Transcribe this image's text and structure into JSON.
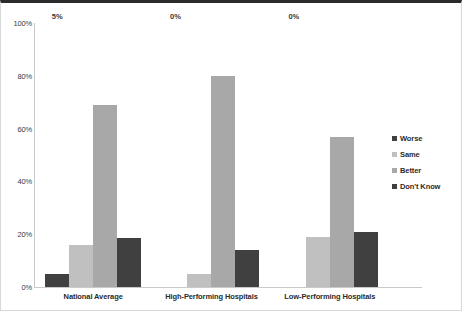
{
  "chart_data": {
    "type": "bar",
    "title": "",
    "xlabel": "",
    "ylabel": "",
    "ylim": [
      0,
      100
    ],
    "ytick_labels": [
      "100%",
      "80%",
      "60%",
      "40%",
      "20%",
      "0%"
    ],
    "ytick_values": [
      100,
      80,
      60,
      40,
      20,
      0
    ],
    "grid": false,
    "legend_position": "right",
    "categories": [
      "National Average",
      "High-Performing Hospitals",
      "Low-Performing Hospitals"
    ],
    "series": [
      {
        "name": "Worse",
        "color": "#404040",
        "values": [
          5,
          0,
          0
        ]
      },
      {
        "name": "Same",
        "color": "#c0c0c0",
        "values": [
          16,
          5,
          19
        ]
      },
      {
        "name": "Better",
        "color": "#a8a8a8",
        "values": [
          69,
          80,
          57
        ]
      },
      {
        "name": "Don't Know",
        "color": "#404040",
        "values": [
          18.5,
          14,
          21
        ]
      }
    ],
    "data_labels": [
      {
        "category": "National Average",
        "series": "Worse",
        "text": "5%"
      },
      {
        "category": "High-Performing Hospitals",
        "series": "Worse",
        "text": "0%"
      },
      {
        "category": "Low-Performing Hospitals",
        "series": "Worse",
        "text": "0%"
      }
    ]
  },
  "legend": {
    "items": [
      {
        "label": "Worse",
        "color": "#404040"
      },
      {
        "label": "Same",
        "color": "#c0c0c0"
      },
      {
        "label": "Better",
        "color": "#a8a8a8"
      },
      {
        "label": "Don't Know",
        "color": "#404040"
      }
    ]
  }
}
